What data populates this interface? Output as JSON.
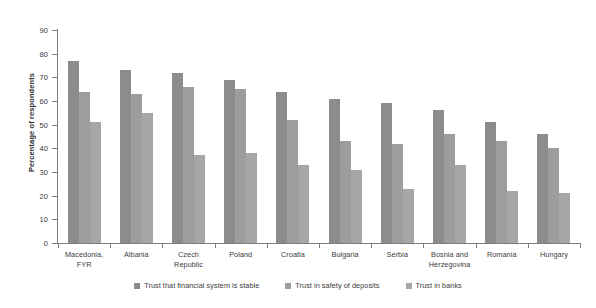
{
  "chart_data": {
    "type": "bar",
    "title": "",
    "subtitle": "",
    "xlabel": "",
    "ylabel": "Percentage of respondents",
    "ylim": [
      0,
      90
    ],
    "ytick_step": 10,
    "yticks": [
      90,
      80,
      70,
      60,
      50,
      40,
      30,
      20,
      10,
      0
    ],
    "grid": false,
    "legend_position": "bottom-center",
    "categories": [
      "Macedonia, FYR",
      "Albania",
      "Czech Republic",
      "Poland",
      "Croatia",
      "Bulgaria",
      "Serbia",
      "Bosnia and Herzegovina",
      "Romania",
      "Hungary"
    ],
    "category_label_lines": [
      [
        "Macedonia,",
        "FYR"
      ],
      [
        "Albania"
      ],
      [
        "Czech",
        "Republic"
      ],
      [
        "Poland"
      ],
      [
        "Croatia"
      ],
      [
        "Bulgaria"
      ],
      [
        "Serbia"
      ],
      [
        "Bosnia and",
        "Herzegovina"
      ],
      [
        "Romania"
      ],
      [
        "Hungary"
      ]
    ],
    "series": [
      {
        "name": "Trust that financial system is stable",
        "color": "#8c8c8c",
        "values": [
          77,
          73,
          72,
          69,
          64,
          61,
          59,
          56,
          51,
          46
        ]
      },
      {
        "name": "Trust in safety of deposits",
        "color": "#9d9d9d",
        "values": [
          64,
          63,
          66,
          65,
          52,
          43,
          42,
          46,
          43,
          40
        ]
      },
      {
        "name": "Trust in banks",
        "color": "#a6a6a6",
        "values": [
          51,
          55,
          37,
          38,
          33,
          31,
          23,
          33,
          22,
          21
        ]
      }
    ]
  },
  "axis": {
    "line_color": "#7d7d7d",
    "tick_color": "#7d7d7d",
    "text_color": "#3c3c3c"
  }
}
